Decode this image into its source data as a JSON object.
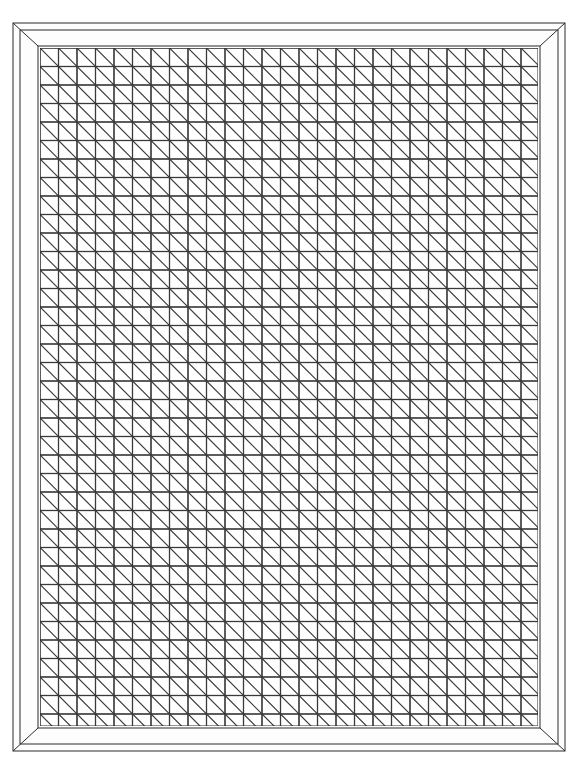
{
  "artwork": {
    "title": "Framed Pinwheel Tessellation",
    "canvas_width": 578,
    "canvas_height": 774,
    "background_color": "#ffffff",
    "line_color": "#3a3a3a",
    "frame_line_color": "#2b2b2b",
    "frame": {
      "name": "mitered-picture-frame",
      "outer_left": 13,
      "outer_top": 23,
      "outer_right": 565,
      "outer_bottom": 751,
      "inner_left": 38,
      "inner_top": 46,
      "inner_right": 540,
      "inner_bottom": 728,
      "bevel_inset": 7,
      "corner_style": "mitered",
      "fill": "#fdfdfd"
    },
    "pattern": {
      "name": "pinwheel-tessellation",
      "type": "windmill-rectangles-with-diagonals",
      "origin_x": 40,
      "origin_y": 48,
      "area_width": 498,
      "area_height": 678,
      "block_size": 37,
      "cell_size": 18.5,
      "columns": 14,
      "rows": 19,
      "line_width": 1.15,
      "description": "Each square block is divided into four congruent rectangles arranged in 90-degree rotational (pinwheel) symmetry; each rectangle carries a diagonal line from corner to corner."
    }
  },
  "chart_data": {
    "type": "table",
    "categories": [
      "block-columns",
      "block-rows",
      "rect-per-block",
      "diagonals-per-block"
    ],
    "values": [
      14,
      19,
      4,
      4
    ],
    "xlabel": "",
    "ylabel": "",
    "legend": []
  }
}
